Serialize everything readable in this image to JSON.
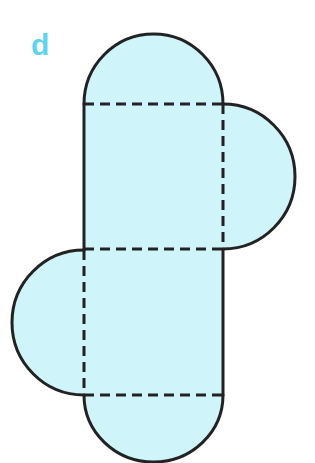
{
  "label": "d",
  "colors": {
    "label": "#5fd3f0",
    "fill": "#cff4fa",
    "stroke": "#222222"
  },
  "diagram": {
    "type": "net-of-solid",
    "parts": [
      "top-semicircle",
      "upper-square",
      "right-semicircle",
      "middle-square",
      "left-semicircle",
      "bottom-semicircle"
    ],
    "fold_lines": 3
  }
}
